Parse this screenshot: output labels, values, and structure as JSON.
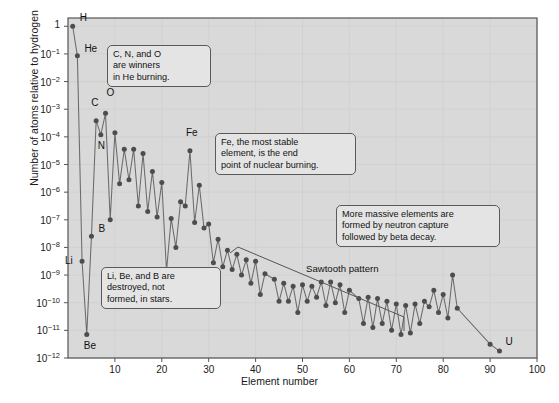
{
  "chart_data": {
    "type": "scatter",
    "title": "",
    "xlabel": "Element number",
    "ylabel": "Number of atoms relative to hydrogen",
    "xlim": [
      0,
      100
    ],
    "ylim_log10": [
      -12,
      0.3
    ],
    "grid": true,
    "legend": "none",
    "xticks": [
      10,
      20,
      30,
      40,
      50,
      60,
      70,
      80,
      90,
      100
    ],
    "yticks": [
      "1",
      "10-1",
      "10-2",
      "10-3",
      "10-4",
      "10-5",
      "10-6",
      "10-7",
      "10-8",
      "10-9",
      "10-10",
      "10-11",
      "10-12"
    ],
    "ytick_labels": [
      {
        "base": "1",
        "exp": ""
      },
      {
        "base": "10",
        "exp": "-1"
      },
      {
        "base": "10",
        "exp": "-2"
      },
      {
        "base": "10",
        "exp": "-3"
      },
      {
        "base": "10",
        "exp": "-4"
      },
      {
        "base": "10",
        "exp": "-5"
      },
      {
        "base": "10",
        "exp": "-6"
      },
      {
        "base": "10",
        "exp": "-7"
      },
      {
        "base": "10",
        "exp": "-8"
      },
      {
        "base": "10",
        "exp": "-9"
      },
      {
        "base": "10",
        "exp": "-10"
      },
      {
        "base": "10",
        "exp": "-11"
      },
      {
        "base": "10",
        "exp": "-12"
      }
    ],
    "series": [
      {
        "name": "Solar system elemental abundance relative to hydrogen",
        "x": [
          1,
          2,
          3,
          4,
          5,
          6,
          7,
          8,
          9,
          10,
          11,
          12,
          13,
          14,
          15,
          16,
          17,
          18,
          19,
          20,
          21,
          22,
          23,
          24,
          25,
          26,
          27,
          28,
          29,
          30,
          31,
          32,
          33,
          34,
          35,
          36,
          37,
          38,
          39,
          40,
          41,
          42,
          44,
          45,
          46,
          47,
          48,
          49,
          50,
          51,
          52,
          53,
          54,
          55,
          56,
          57,
          58,
          59,
          60,
          62,
          63,
          64,
          65,
          66,
          67,
          68,
          69,
          70,
          71,
          72,
          73,
          74,
          75,
          76,
          77,
          78,
          79,
          80,
          81,
          82,
          83,
          90,
          92
        ],
        "y_log10": [
          0,
          -1.07,
          -8.5,
          -11.15,
          -7.6,
          -3.42,
          -3.92,
          -3.15,
          -7.0,
          -3.85,
          -5.7,
          -4.45,
          -5.55,
          -4.45,
          -6.5,
          -4.6,
          -6.7,
          -5.25,
          -6.9,
          -5.65,
          -8.85,
          -6.95,
          -8.0,
          -6.35,
          -6.5,
          -4.5,
          -7.1,
          -5.75,
          -7.3,
          -7.15,
          -8.55,
          -7.7,
          -8.7,
          -8.1,
          -8.8,
          -8.25,
          -9.0,
          -8.45,
          -9.3,
          -8.5,
          -9.7,
          -8.95,
          -9.15,
          -9.95,
          -9.3,
          -9.95,
          -9.4,
          -10.35,
          -9.35,
          -9.95,
          -9.4,
          -9.8,
          -9.25,
          -10.1,
          -9.25,
          -10.0,
          -9.35,
          -10.35,
          -9.55,
          -9.85,
          -10.75,
          -9.8,
          -10.9,
          -9.85,
          -10.75,
          -9.95,
          -11.0,
          -10.05,
          -11.15,
          -10.1,
          -11.1,
          -10.05,
          -10.75,
          -9.95,
          -10.15,
          -9.55,
          -10.35,
          -9.7,
          -10.55,
          -9.0,
          -10.2,
          -11.5,
          -11.75
        ]
      }
    ],
    "point_labels": [
      {
        "text": "H",
        "x": 1
      },
      {
        "text": "He",
        "x": 2
      },
      {
        "text": "Li",
        "x": 3
      },
      {
        "text": "Be",
        "x": 4
      },
      {
        "text": "B",
        "x": 5
      },
      {
        "text": "C",
        "x": 6
      },
      {
        "text": "N",
        "x": 7
      },
      {
        "text": "O",
        "x": 8
      },
      {
        "text": "Fe",
        "x": 26
      },
      {
        "text": "U",
        "x": 92
      }
    ],
    "annotations": [
      {
        "id": "he-burning",
        "text": "C, N, and O\nare winners\nin He burning."
      },
      {
        "id": "iron-peak",
        "text": "Fe, the most stable\nelement, is the end\npoint of nuclear burning."
      },
      {
        "id": "neutron-capture",
        "text": "More massive elements are\nformed by neutron capture\nfollowed by beta decay."
      },
      {
        "id": "light-element-destruction",
        "text": "Li, Be, and B are\ndestroyed, not\nformed, in stars."
      },
      {
        "id": "sawtooth",
        "text": "Sawtooth pattern"
      }
    ],
    "colors": {
      "plot_background": "#d9d9d9",
      "marker": "#4d4d4d",
      "line": "#6b6b6b",
      "grid": "#cfcfcf",
      "frame": "#555555",
      "callout_background": "#e4e4e4",
      "callout_border": "#5a5a5a",
      "text": "#111111"
    }
  }
}
